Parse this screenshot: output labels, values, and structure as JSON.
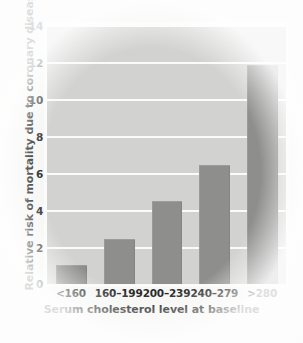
{
  "chart_data": {
    "type": "bar",
    "title": "",
    "xlabel": "Serum cholesterol level at baseline",
    "ylabel": "Relative risk of mortality due to coronary disease",
    "categories": [
      "<160",
      "160–199",
      "200–239",
      "240–279",
      ">280"
    ],
    "values": [
      1.0,
      2.4,
      4.45,
      6.4,
      11.8
    ],
    "ylim": [
      0,
      14
    ],
    "yticks": [
      0,
      2,
      4,
      6,
      8,
      10,
      12,
      14
    ],
    "ytick_labels": [
      "0",
      "2",
      "4",
      "6",
      "8",
      "10",
      "12",
      "14"
    ],
    "grid": "horizontal",
    "legend": "none",
    "colors": {
      "bar": "#8e8e8d",
      "plot_background": "#d2d2d1",
      "gridline": "#fbfbfa",
      "text": "#1f1f1f",
      "page_background": "#f2f2f1"
    }
  }
}
